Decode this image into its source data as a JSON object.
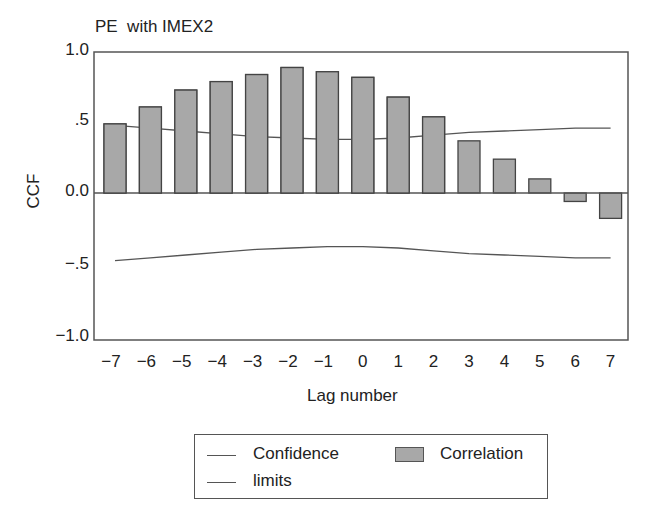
{
  "chart_data": {
    "type": "bar",
    "title": "PE  with IMEX2",
    "xlabel": "Lag number",
    "ylabel": "CCF",
    "ylim": [
      -1.0,
      1.0
    ],
    "yticks": [
      "1.0",
      ".5",
      "0.0",
      "-.5",
      "-1.0"
    ],
    "categories": [
      "-7",
      "-6",
      "-5",
      "-4",
      "-3",
      "-2",
      "-1",
      "0",
      "1",
      "2",
      "3",
      "4",
      "5",
      "6",
      "7"
    ],
    "series": [
      {
        "name": "Correlation",
        "type": "bar",
        "values": [
          0.49,
          0.61,
          0.73,
          0.79,
          0.84,
          0.89,
          0.86,
          0.82,
          0.68,
          0.54,
          0.37,
          0.24,
          0.1,
          -0.06,
          -0.18
        ]
      },
      {
        "name": "Confidence limits (upper)",
        "type": "line",
        "values": [
          0.48,
          0.46,
          0.44,
          0.42,
          0.4,
          0.39,
          0.38,
          0.38,
          0.39,
          0.41,
          0.43,
          0.44,
          0.45,
          0.46,
          0.46
        ]
      },
      {
        "name": "Confidence limits (lower)",
        "type": "line",
        "values": [
          -0.48,
          -0.46,
          -0.44,
          -0.42,
          -0.4,
          -0.39,
          -0.38,
          -0.38,
          -0.39,
          -0.41,
          -0.43,
          -0.44,
          -0.45,
          -0.46,
          -0.46
        ]
      }
    ],
    "legend": {
      "position": "bottom",
      "entries": [
        {
          "label_line1": "Confidence",
          "label_line2": "limits",
          "symbol": "line"
        },
        {
          "label": "Correlation",
          "symbol": "bar"
        }
      ]
    },
    "grid": false,
    "colors": {
      "bar_fill": "#a8a8a8",
      "bar_edge": "#444444",
      "line": "#555555",
      "frame": "#555555"
    }
  }
}
